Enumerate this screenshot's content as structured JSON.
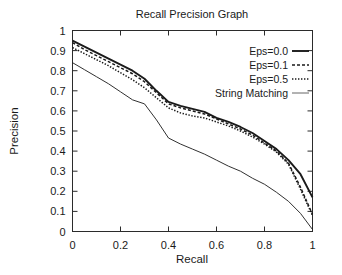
{
  "chart_data": {
    "type": "line",
    "title": "Recall Precision Graph",
    "xlabel": "Recall",
    "ylabel": "Precision",
    "xlim": [
      0,
      1
    ],
    "ylim": [
      0,
      1
    ],
    "grid": false,
    "legend_position": "top-right",
    "xticks": [
      "0",
      "0.2",
      "0.4",
      "0.6",
      "0.8",
      "1"
    ],
    "xtick_values": [
      0,
      0.2,
      0.4,
      0.6,
      0.8,
      1
    ],
    "yticks": [
      "0",
      "0.1",
      "0.2",
      "0.3",
      "0.4",
      "0.5",
      "0.6",
      "0.7",
      "0.8",
      "0.9",
      "1"
    ],
    "ytick_values": [
      0,
      0.1,
      0.2,
      0.3,
      0.4,
      0.5,
      0.6,
      0.7,
      0.8,
      0.9,
      1
    ],
    "x": [
      0,
      0.05,
      0.1,
      0.15,
      0.2,
      0.25,
      0.3,
      0.35,
      0.4,
      0.45,
      0.5,
      0.55,
      0.6,
      0.65,
      0.7,
      0.75,
      0.8,
      0.85,
      0.9,
      0.95,
      1
    ],
    "series": [
      {
        "name": "Eps=0.0",
        "style": "solid",
        "color": "#1a1a1a",
        "values": [
          0.95,
          0.92,
          0.89,
          0.86,
          0.83,
          0.8,
          0.76,
          0.7,
          0.645,
          0.625,
          0.61,
          0.595,
          0.565,
          0.545,
          0.52,
          0.49,
          0.45,
          0.41,
          0.355,
          0.285,
          0.17
        ]
      },
      {
        "name": "Eps=0.1",
        "style": "dashed",
        "color": "#1a1a1a",
        "values": [
          0.94,
          0.905,
          0.875,
          0.845,
          0.815,
          0.785,
          0.745,
          0.69,
          0.635,
          0.615,
          0.6,
          0.585,
          0.56,
          0.535,
          0.51,
          0.48,
          0.44,
          0.4,
          0.34,
          0.22,
          0.085
        ]
      },
      {
        "name": "Eps=0.5",
        "style": "dotted",
        "color": "#1a1a1a",
        "values": [
          0.915,
          0.885,
          0.855,
          0.825,
          0.79,
          0.755,
          0.715,
          0.665,
          0.615,
          0.59,
          0.575,
          0.565,
          0.545,
          0.525,
          0.5,
          0.47,
          0.435,
          0.395,
          0.335,
          0.21,
          0.08
        ]
      },
      {
        "name": "String Matching",
        "style": "thin-solid",
        "color": "#555555",
        "values": [
          0.84,
          0.805,
          0.77,
          0.735,
          0.695,
          0.655,
          0.635,
          0.555,
          0.465,
          0.435,
          0.41,
          0.385,
          0.355,
          0.325,
          0.3,
          0.265,
          0.235,
          0.195,
          0.15,
          0.09,
          0.01
        ]
      }
    ]
  },
  "legend": {
    "items": [
      {
        "label": "Eps=0.0"
      },
      {
        "label": "Eps=0.1"
      },
      {
        "label": "Eps=0.5"
      },
      {
        "label": "String Matching"
      }
    ]
  }
}
